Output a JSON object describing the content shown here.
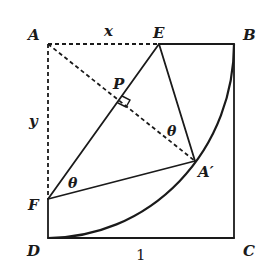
{
  "figure": {
    "type": "geometry-diagram",
    "points": {
      "A": {
        "label": "A",
        "x": 48,
        "y": 44
      },
      "B": {
        "label": "B",
        "x": 234,
        "y": 44
      },
      "C": {
        "label": "C",
        "x": 234,
        "y": 238
      },
      "D": {
        "label": "D",
        "x": 48,
        "y": 238
      },
      "E": {
        "label": "E",
        "x": 159,
        "y": 44
      },
      "F": {
        "label": "F",
        "x": 48,
        "y": 199
      },
      "A_prime": {
        "label": "A′",
        "x": 195,
        "y": 161
      },
      "P": {
        "label": "P",
        "x": 120,
        "y": 102
      }
    },
    "segment_labels": {
      "AE": "x",
      "AF": "y",
      "DC": "1"
    },
    "angle_labels": {
      "at_F": "θ",
      "at_A_prime": "θ"
    },
    "colors": {
      "stroke": "#1a1a1a",
      "background": "#ffffff"
    }
  }
}
